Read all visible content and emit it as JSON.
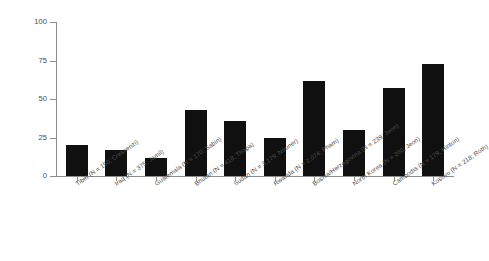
{
  "chart_data": {
    "type": "bar",
    "title": "",
    "xlabel": "",
    "ylabel": "Percentage With PTSD",
    "ylim": [
      0,
      100
    ],
    "yticks": [
      "0",
      "25",
      "50",
      "75",
      "100"
    ],
    "ytick_values": [
      0,
      25,
      50,
      75,
      100
    ],
    "grid": false,
    "legend": "none",
    "bar_color": "#101010",
    "axis_color": "#8d8d8d",
    "categories": [
      "Tibet (N = 150; Crescenzi)",
      "Iraq (N = 375; Jamil)",
      "Guatemala (N = 170; Sabin)",
      "Bhutan (N = 418; Thapa)",
      "Sudan (N = 3,179; Neuner)",
      "Rwanda (N = 2,074; Pham)",
      "Bosnia/Herzegovina (N = 239; Jeon)",
      "North Korea (N = 200; Jeon)",
      "Cambodia (N = 179; Hinton)",
      "Kosovo (N = 218; Roth)"
    ],
    "values": [
      20,
      17,
      12,
      43,
      36,
      25,
      62,
      30,
      57,
      73
    ]
  }
}
